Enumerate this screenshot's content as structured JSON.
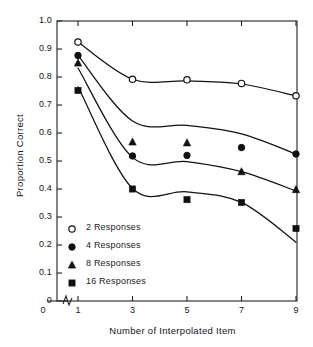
{
  "chart_data": {
    "type": "line",
    "title": "",
    "xlabel": "Number of Interpolated Item",
    "ylabel": "Proportion Correct",
    "x": [
      1,
      3,
      5,
      7,
      9
    ],
    "xlim": [
      0,
      9
    ],
    "ylim": [
      0.0,
      1.0
    ],
    "xticks": [
      "0",
      "1",
      "3",
      "5",
      "7",
      "9"
    ],
    "xtick_values": [
      0,
      1,
      3,
      5,
      7,
      9
    ],
    "yticks": [
      "0",
      "0.1",
      "0.2",
      "0.3",
      "0.4",
      "0.5",
      "0.6",
      "0.7",
      "0.8",
      "0.9",
      "1.0"
    ],
    "ytick_values": [
      0,
      0.1,
      0.2,
      0.3,
      0.4,
      0.5,
      0.6,
      0.7,
      0.8,
      0.9,
      1.0
    ],
    "axis_break": true,
    "axis_break_note": "broken x-axis between 0 and 1",
    "grid": false,
    "legend_position": "lower-left inside axes",
    "series": [
      {
        "name": "2 Responses",
        "marker": "open-circle",
        "values": [
          0.925,
          0.792,
          0.79,
          0.777,
          0.733
        ],
        "curve": [
          0.925,
          0.792,
          0.786,
          0.775,
          0.733
        ]
      },
      {
        "name": "4 Responses",
        "marker": "filled-circle",
        "values": [
          0.877,
          0.518,
          0.52,
          0.548,
          0.525
        ],
        "curve": [
          0.877,
          0.643,
          0.627,
          0.597,
          0.525
        ]
      },
      {
        "name": "8 Responses",
        "marker": "filled-triangle",
        "values": [
          0.85,
          0.568,
          0.565,
          0.462,
          0.398
        ],
        "curve": [
          0.832,
          0.513,
          0.498,
          0.462,
          0.393
        ]
      },
      {
        "name": "16 Responses",
        "marker": "filled-square",
        "values": [
          0.752,
          0.4,
          0.362,
          0.352,
          0.259
        ],
        "curve": [
          0.765,
          0.402,
          0.39,
          0.352,
          0.21
        ]
      }
    ]
  },
  "legend": {
    "items": [
      {
        "label": "2 Responses",
        "marker": "open-circle"
      },
      {
        "label": "4 Responses",
        "marker": "filled-circle"
      },
      {
        "label": "8 Responses",
        "marker": "filled-triangle"
      },
      {
        "label": "16 Responses",
        "marker": "filled-square"
      }
    ]
  },
  "style": {
    "line_color": "#111111",
    "marker_color": "#111111",
    "axis_color": "#222222",
    "background": "#ffffff"
  }
}
